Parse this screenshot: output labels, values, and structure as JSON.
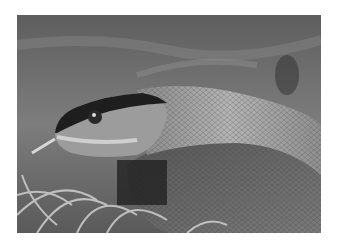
{
  "image": {
    "subject": "snake",
    "description": "Grayscale close-up photograph of a snake's head and coiled body resting on dry grass",
    "colors": {
      "background": "#ffffff",
      "dark": "#1e1e1e",
      "mid": "#7a7a7a",
      "light": "#cfcfcf"
    }
  }
}
